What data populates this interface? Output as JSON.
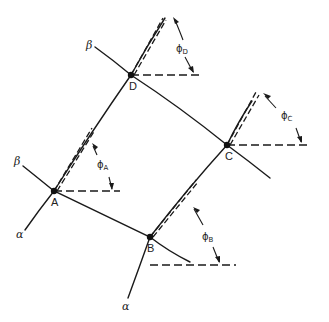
{
  "diagram": {
    "colors": {
      "line": "#1a1a1a",
      "background": "#ffffff"
    },
    "nodes": [
      {
        "id": "A",
        "label": "A",
        "x": 54,
        "y": 191
      },
      {
        "id": "B",
        "label": "B",
        "x": 150,
        "y": 237
      },
      {
        "id": "C",
        "label": "C",
        "x": 227,
        "y": 145
      },
      {
        "id": "D",
        "label": "D",
        "x": 131,
        "y": 75
      }
    ],
    "line_labels": {
      "beta_top": "β",
      "beta_left": "β",
      "alpha_left": "α",
      "alpha_bottom": "α"
    },
    "angles": {
      "A": {
        "symbol": "ϕ",
        "sub": "A"
      },
      "B": {
        "symbol": "ϕ",
        "sub": "B"
      },
      "C": {
        "symbol": "ϕ",
        "sub": "C"
      },
      "D": {
        "symbol": "ϕ",
        "sub": "D"
      }
    }
  }
}
